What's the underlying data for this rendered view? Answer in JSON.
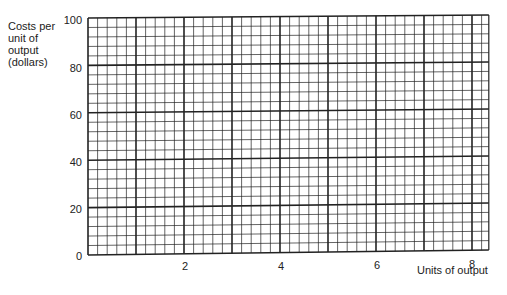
{
  "chart_data": {
    "type": "line",
    "title": "",
    "xlabel": "Units of output",
    "ylabel": "Costs per unit of output (dollars)",
    "ylabel_lines": [
      "Costs per",
      "unit of",
      "output",
      "(dollars)"
    ],
    "x_ticks": [
      "2",
      "4",
      "6",
      "8"
    ],
    "y_ticks": [
      "0",
      "20",
      "40",
      "60",
      "80",
      "100"
    ],
    "xlim": [
      0,
      8.35
    ],
    "ylim": [
      0,
      100
    ],
    "grid": true,
    "grid_minor_per_major_x": 5,
    "grid_minor_per_major_y": 5,
    "series": [],
    "note": "Blank graph paper grid with no plotted data"
  },
  "colors": {
    "grid": "#222222",
    "background": "#ffffff"
  }
}
